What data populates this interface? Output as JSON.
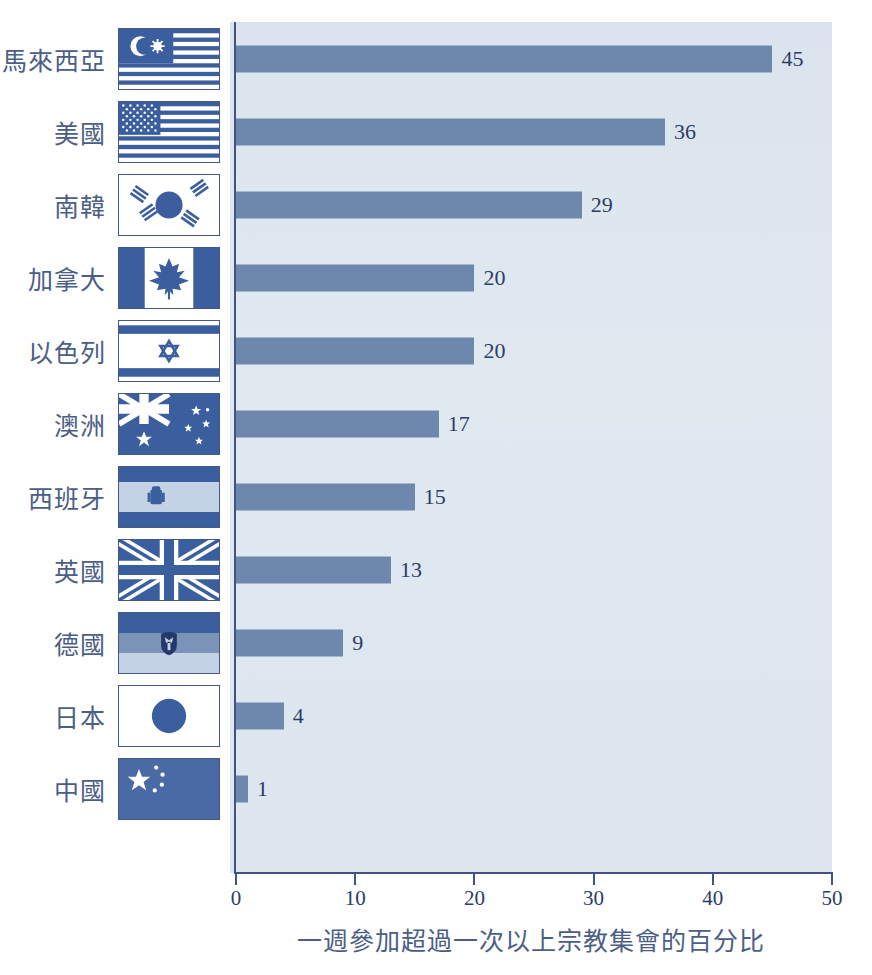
{
  "chart_data": {
    "type": "bar",
    "orientation": "horizontal",
    "title": "",
    "xlabel": "一週參加超過一次以上宗教集會的百分比",
    "ylabel": "",
    "xlim": [
      0,
      50
    ],
    "xticks": [
      0,
      10,
      20,
      30,
      40,
      50
    ],
    "grid": false,
    "legend": null,
    "categories": [
      "馬來西亞",
      "美國",
      "南韓",
      "加拿大",
      "以色列",
      "澳洲",
      "西班牙",
      "英國",
      "德國",
      "日本",
      "中國"
    ],
    "values": [
      45,
      36,
      29,
      20,
      20,
      17,
      15,
      13,
      9,
      4,
      1
    ],
    "value_labels": [
      "45",
      "36",
      "29",
      "20",
      "20",
      "17",
      "15",
      "13",
      "9",
      "4",
      "1"
    ],
    "flags": [
      "malaysia-flag",
      "usa-flag",
      "south-korea-flag",
      "canada-flag",
      "israel-flag",
      "australia-flag",
      "spain-flag",
      "united-kingdom-flag",
      "germany-flag",
      "japan-flag",
      "china-flag"
    ]
  },
  "colors": {
    "bar": "#6e87ad",
    "plot_background": "#dfe7ef",
    "axis": "#41537e",
    "label_text": "#4b5f86",
    "value_text": "#2c3d66",
    "page_background": "#fefefe"
  },
  "axis": {
    "tick_labels": [
      "0",
      "10",
      "20",
      "30",
      "40",
      "50"
    ]
  },
  "caption": {
    "text": "一週參加超過一次以上宗教集會的百分比"
  }
}
